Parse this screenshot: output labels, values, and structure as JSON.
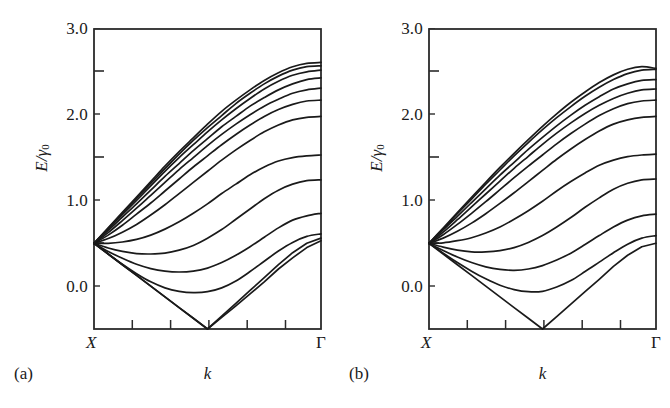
{
  "figure": {
    "background_color": "#ffffff",
    "line_color": "#1a1a1a",
    "axis_color": "#2b2b2b"
  },
  "panels": [
    {
      "caption": "(a)",
      "x_axis": {
        "title": "k",
        "left_label": "X",
        "right_label": "Γ",
        "n_interior_ticks": 5
      },
      "y_axis": {
        "title_num": "E",
        "title_slash": "/",
        "title_gamma": "γ",
        "title_sub": "0",
        "ticks": [
          "0.0",
          "1.0",
          "2.0",
          "3.0"
        ]
      }
    },
    {
      "caption": "(b)",
      "x_axis": {
        "title": "k",
        "left_label": "X",
        "right_label": "Γ",
        "n_interior_ticks": 5
      },
      "y_axis": {
        "title_num": "E",
        "title_slash": "/",
        "title_gamma": "γ",
        "title_sub": "0",
        "ticks": [
          "0.0",
          "1.0",
          "2.0",
          "3.0"
        ]
      }
    }
  ],
  "chart_data": [
    {
      "type": "line",
      "panel": "(a)",
      "title": "",
      "xlabel": "k",
      "ylabel": "E/γ₀",
      "xlim": [
        0,
        1
      ],
      "ylim": [
        0.0,
        3.5
      ],
      "xtick_labels": [
        "X",
        "Γ"
      ],
      "xtick_positions": [
        0,
        1
      ],
      "ytick_labels": [
        "0.0",
        "1.0",
        "2.0",
        "3.0"
      ],
      "ytick_values": [
        0.0,
        1.0,
        2.0,
        3.0
      ],
      "yminor_values": [
        0.5,
        1.5,
        2.5,
        3.5
      ],
      "grid": false,
      "legend": "none",
      "x": [
        0.0,
        0.0625,
        0.125,
        0.1875,
        0.25,
        0.3125,
        0.375,
        0.4375,
        0.5,
        0.5625,
        0.625,
        0.6875,
        0.75,
        0.8125,
        0.875,
        0.9375,
        1.0
      ],
      "series": [
        {
          "name": "band-1-lower-v",
          "values": [
            1.0,
            0.875,
            0.75,
            0.625,
            0.5,
            0.375,
            0.25,
            0.125,
            0.0,
            0.135,
            0.27,
            0.41,
            0.55,
            0.7,
            0.83,
            0.95,
            1.03
          ]
        },
        {
          "name": "band-2-lower-v",
          "values": [
            1.0,
            0.875,
            0.75,
            0.625,
            0.5,
            0.375,
            0.25,
            0.125,
            0.0,
            0.15,
            0.3,
            0.45,
            0.6,
            0.75,
            0.89,
            1.0,
            1.06
          ]
        },
        {
          "name": "band-3",
          "values": [
            1.0,
            0.875,
            0.755,
            0.645,
            0.55,
            0.48,
            0.44,
            0.425,
            0.435,
            0.48,
            0.56,
            0.67,
            0.79,
            0.91,
            1.01,
            1.08,
            1.11
          ]
        },
        {
          "name": "band-4",
          "values": [
            1.0,
            0.905,
            0.825,
            0.755,
            0.705,
            0.675,
            0.665,
            0.675,
            0.71,
            0.775,
            0.86,
            0.96,
            1.07,
            1.18,
            1.27,
            1.32,
            1.35
          ]
        },
        {
          "name": "band-5",
          "values": [
            1.0,
            0.945,
            0.905,
            0.88,
            0.875,
            0.885,
            0.92,
            0.975,
            1.06,
            1.16,
            1.28,
            1.4,
            1.52,
            1.62,
            1.69,
            1.73,
            1.74
          ]
        },
        {
          "name": "band-6",
          "values": [
            1.0,
            1.0,
            1.015,
            1.045,
            1.095,
            1.165,
            1.25,
            1.35,
            1.46,
            1.58,
            1.69,
            1.8,
            1.89,
            1.96,
            2.0,
            2.02,
            2.03
          ]
        },
        {
          "name": "band-7",
          "values": [
            1.0,
            1.055,
            1.13,
            1.22,
            1.33,
            1.45,
            1.58,
            1.71,
            1.84,
            1.97,
            2.09,
            2.2,
            2.3,
            2.38,
            2.44,
            2.47,
            2.48
          ]
        },
        {
          "name": "band-8",
          "values": [
            1.0,
            1.095,
            1.21,
            1.34,
            1.47,
            1.61,
            1.75,
            1.89,
            2.02,
            2.15,
            2.27,
            2.38,
            2.48,
            2.56,
            2.62,
            2.66,
            2.67
          ]
        },
        {
          "name": "band-9",
          "values": [
            1.0,
            1.125,
            1.265,
            1.41,
            1.56,
            1.71,
            1.86,
            2.0,
            2.14,
            2.27,
            2.39,
            2.5,
            2.6,
            2.68,
            2.75,
            2.79,
            2.81
          ]
        },
        {
          "name": "band-10",
          "values": [
            1.0,
            1.15,
            1.305,
            1.46,
            1.62,
            1.78,
            1.93,
            2.08,
            2.22,
            2.36,
            2.48,
            2.6,
            2.7,
            2.79,
            2.86,
            2.91,
            2.93
          ]
        },
        {
          "name": "band-11",
          "values": [
            1.0,
            1.165,
            1.335,
            1.5,
            1.67,
            1.84,
            2.0,
            2.15,
            2.3,
            2.44,
            2.57,
            2.69,
            2.8,
            2.89,
            2.96,
            3.0,
            3.02
          ]
        },
        {
          "name": "band-12",
          "values": [
            1.0,
            1.175,
            1.35,
            1.525,
            1.7,
            1.87,
            2.04,
            2.2,
            2.35,
            2.49,
            2.63,
            2.75,
            2.86,
            2.95,
            3.02,
            3.06,
            3.07
          ]
        },
        {
          "name": "band-13",
          "values": [
            1.0,
            1.18,
            1.36,
            1.54,
            1.72,
            1.9,
            2.07,
            2.23,
            2.39,
            2.54,
            2.67,
            2.79,
            2.9,
            2.99,
            3.06,
            3.1,
            3.11
          ]
        }
      ]
    },
    {
      "type": "line",
      "panel": "(b)",
      "title": "",
      "xlabel": "k",
      "ylabel": "E/γ₀",
      "xlim": [
        0,
        1
      ],
      "ylim": [
        0.0,
        3.5
      ],
      "xtick_labels": [
        "X",
        "Γ"
      ],
      "xtick_positions": [
        0,
        1
      ],
      "ytick_labels": [
        "0.0",
        "1.0",
        "2.0",
        "3.0"
      ],
      "ytick_values": [
        0.0,
        1.0,
        2.0,
        3.0
      ],
      "yminor_values": [
        0.5,
        1.5,
        2.5,
        3.5
      ],
      "grid": false,
      "legend": "none",
      "x": [
        0.0,
        0.0625,
        0.125,
        0.1875,
        0.25,
        0.3125,
        0.375,
        0.4375,
        0.5,
        0.5625,
        0.625,
        0.6875,
        0.75,
        0.8125,
        0.875,
        0.9375,
        1.0
      ],
      "series": [
        {
          "name": "band-1-lower-v",
          "values": [
            1.0,
            0.875,
            0.75,
            0.625,
            0.5,
            0.375,
            0.25,
            0.125,
            0.0,
            0.145,
            0.29,
            0.435,
            0.58,
            0.73,
            0.86,
            0.96,
            1.0
          ]
        },
        {
          "name": "band-2",
          "values": [
            1.0,
            0.885,
            0.775,
            0.675,
            0.585,
            0.51,
            0.46,
            0.435,
            0.44,
            0.49,
            0.565,
            0.67,
            0.78,
            0.89,
            0.99,
            1.06,
            1.09
          ]
        },
        {
          "name": "band-3",
          "values": [
            1.0,
            0.915,
            0.84,
            0.775,
            0.725,
            0.695,
            0.685,
            0.7,
            0.74,
            0.805,
            0.885,
            0.985,
            1.09,
            1.19,
            1.27,
            1.32,
            1.34
          ]
        },
        {
          "name": "band-4",
          "values": [
            1.0,
            0.955,
            0.92,
            0.9,
            0.9,
            0.915,
            0.95,
            1.01,
            1.09,
            1.19,
            1.3,
            1.42,
            1.53,
            1.63,
            1.7,
            1.74,
            1.75
          ]
        },
        {
          "name": "band-5",
          "values": [
            1.0,
            1.005,
            1.03,
            1.065,
            1.12,
            1.19,
            1.28,
            1.38,
            1.49,
            1.61,
            1.72,
            1.82,
            1.91,
            1.97,
            2.01,
            2.03,
            2.04
          ]
        },
        {
          "name": "band-6",
          "values": [
            1.0,
            1.06,
            1.14,
            1.235,
            1.345,
            1.465,
            1.59,
            1.72,
            1.85,
            1.98,
            2.1,
            2.21,
            2.31,
            2.39,
            2.44,
            2.47,
            2.48
          ]
        },
        {
          "name": "band-7",
          "values": [
            1.0,
            1.1,
            1.22,
            1.35,
            1.485,
            1.625,
            1.765,
            1.9,
            2.03,
            2.16,
            2.28,
            2.39,
            2.49,
            2.57,
            2.63,
            2.66,
            2.67
          ]
        },
        {
          "name": "band-8",
          "values": [
            1.0,
            1.13,
            1.275,
            1.425,
            1.575,
            1.725,
            1.875,
            2.015,
            2.155,
            2.285,
            2.405,
            2.515,
            2.61,
            2.69,
            2.75,
            2.79,
            2.8
          ]
        },
        {
          "name": "band-9",
          "values": [
            1.0,
            1.155,
            1.315,
            1.475,
            1.635,
            1.795,
            1.945,
            2.095,
            2.235,
            2.37,
            2.495,
            2.61,
            2.71,
            2.8,
            2.86,
            2.9,
            2.91
          ]
        },
        {
          "name": "band-10",
          "values": [
            1.0,
            1.17,
            1.345,
            1.515,
            1.69,
            1.855,
            2.02,
            2.175,
            2.325,
            2.465,
            2.595,
            2.715,
            2.82,
            2.91,
            2.98,
            3.02,
            3.03
          ]
        },
        {
          "name": "band-11",
          "values": [
            1.0,
            1.178,
            1.357,
            1.535,
            1.712,
            1.885,
            2.05,
            2.21,
            2.365,
            2.51,
            2.645,
            2.765,
            2.875,
            2.965,
            3.03,
            3.06,
            3.04
          ]
        }
      ]
    }
  ]
}
